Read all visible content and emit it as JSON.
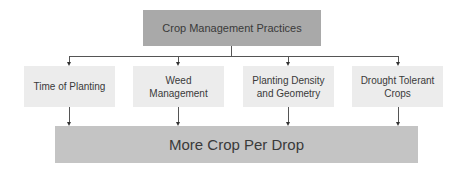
{
  "diagram": {
    "top": {
      "label": "Crop Management Practices",
      "color": "#a9a9a9"
    },
    "children": [
      {
        "label": "Time of Planting"
      },
      {
        "label": "Weed Management"
      },
      {
        "label": "Planting Density and Geometry"
      },
      {
        "label": "Drought Tolerant Crops"
      }
    ],
    "outcome": {
      "label": "More Crop Per Drop",
      "color": "#c4c4c4"
    },
    "child_color": "#ececec",
    "connector_color": "#555555"
  }
}
